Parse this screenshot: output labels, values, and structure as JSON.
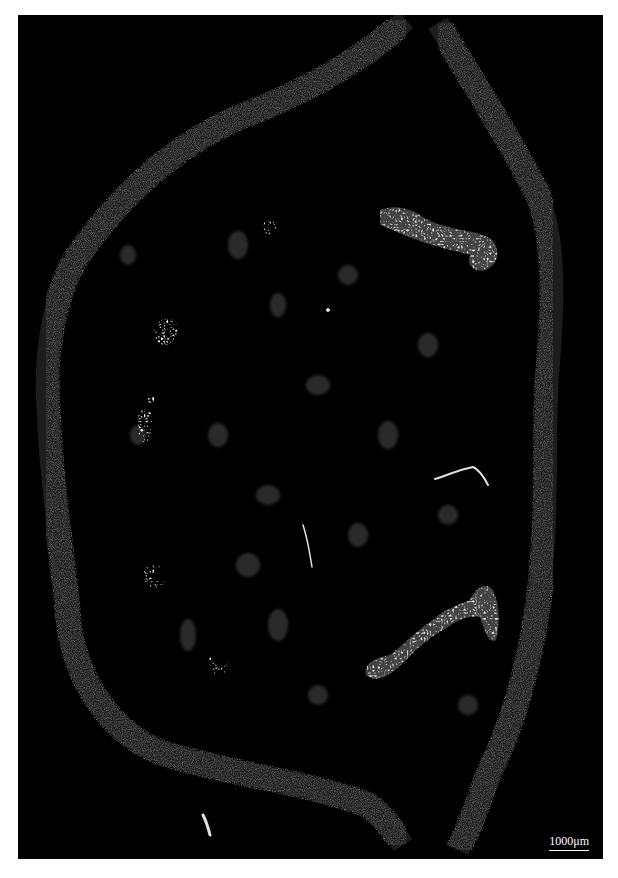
{
  "image": {
    "description": "Fluorescence micrograph of plant stem/petiole cross-section",
    "background_color": "#000000",
    "border_color": "#ffffff",
    "tissue_color": "#8a8a8a",
    "bundle_color": "#e6e6e6"
  },
  "scale_bar": {
    "label": "1000μm"
  },
  "features": [
    {
      "name": "outer-epidermal-band",
      "type": "ring"
    },
    {
      "name": "large-vascular-bundle-upper-right"
    },
    {
      "name": "large-vascular-bundle-lower-right"
    },
    {
      "name": "small-bundle-upper-left"
    },
    {
      "name": "small-bundle-mid-left"
    },
    {
      "name": "small-bundle-lower-left"
    },
    {
      "name": "small-bundle-bottom-left"
    },
    {
      "name": "round-bundle-top"
    },
    {
      "name": "fiber-strand-right"
    },
    {
      "name": "fiber-strand-center"
    },
    {
      "name": "fiber-strand-bottom"
    }
  ]
}
